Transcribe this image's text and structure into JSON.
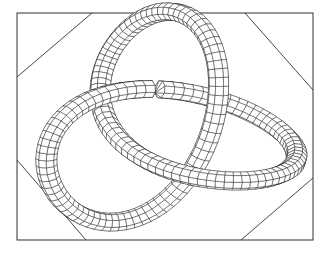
{
  "figure": {
    "kind": "wireframe-tube-knot",
    "colors": {
      "background": "#ffffff",
      "line": "#1a1a1a",
      "frame": "#333333"
    },
    "frame": {
      "x1": 17,
      "y1": 13,
      "x2": 313,
      "y2": 240,
      "corner_cuts": [
        {
          "corner": "top-left",
          "from": [
            17,
            77
          ],
          "to": [
            92,
            13
          ]
        },
        {
          "corner": "top-right",
          "from": [
            245,
            13
          ],
          "to": [
            313,
            90
          ]
        },
        {
          "corner": "bottom-right",
          "from": [
            241,
            240
          ],
          "to": [
            313,
            178
          ]
        },
        {
          "corner": "bottom-left",
          "from": [
            17,
            160
          ],
          "to": [
            86,
            240
          ]
        }
      ]
    },
    "knot": {
      "type": "trefoil",
      "center": [
        166,
        126
      ],
      "scale": 48,
      "tube_radius": 11,
      "rotation_deg": -8,
      "segments": 150,
      "sides": 8
    }
  }
}
